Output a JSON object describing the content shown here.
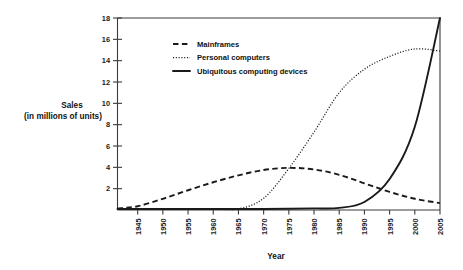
{
  "chart_data": {
    "type": "line",
    "title": "",
    "xlabel": "Year",
    "ylabel": "Sales\n(in millions of units)",
    "ylabel_line1": "Sales",
    "ylabel_line2": "(in millions of units)",
    "xlim": [
      1941,
      2005
    ],
    "ylim": [
      0,
      18
    ],
    "grid": false,
    "legend_position": "upper-left-inside",
    "ytick_labels": [
      "2",
      "4",
      "6",
      "8",
      "10",
      "12",
      "14",
      "16",
      "18"
    ],
    "ytick_values": [
      2,
      4,
      6,
      8,
      10,
      12,
      14,
      16,
      18
    ],
    "xtick_labels": [
      "1945",
      "1950",
      "1955",
      "1960",
      "1965",
      "1970",
      "1975",
      "1980",
      "1985",
      "1990",
      "1995",
      "2000",
      "2005"
    ],
    "xtick_values": [
      1945,
      1950,
      1955,
      1960,
      1965,
      1970,
      1975,
      1980,
      1985,
      1990,
      1995,
      2000,
      2005
    ],
    "x": [
      1941,
      1945,
      1950,
      1955,
      1960,
      1965,
      1970,
      1975,
      1980,
      1985,
      1990,
      1995,
      2000,
      2005
    ],
    "series": [
      {
        "name": "Mainframes",
        "style": "dashed",
        "color": "#1a1a1a",
        "values": [
          0.15,
          0.35,
          1.05,
          1.85,
          2.6,
          3.25,
          3.75,
          3.95,
          3.8,
          3.3,
          2.5,
          1.7,
          1.05,
          0.65
        ]
      },
      {
        "name": "Personal computers",
        "style": "dotted",
        "color": "#1a1a1a",
        "values": [
          0.1,
          0.1,
          0.1,
          0.1,
          0.1,
          0.1,
          1.1,
          3.9,
          7.3,
          11.0,
          13.2,
          14.4,
          15.1,
          14.9
        ]
      },
      {
        "name": "Ubiquitous computing devices",
        "style": "solid",
        "color": "#1a1a1a",
        "values": [
          0.1,
          0.1,
          0.1,
          0.1,
          0.1,
          0.1,
          0.1,
          0.12,
          0.15,
          0.2,
          0.75,
          2.9,
          7.8,
          18.0
        ]
      }
    ]
  },
  "legend": {
    "items": [
      {
        "label": "Mainframes",
        "style": "dashed"
      },
      {
        "label": "Personal computers",
        "style": "dotted"
      },
      {
        "label": "Ubiquitous computing devices",
        "style": "solid"
      }
    ]
  }
}
